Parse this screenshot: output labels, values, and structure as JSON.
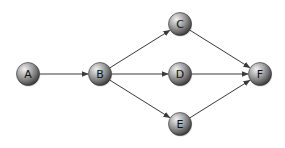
{
  "diagram": {
    "type": "directed-graph",
    "colors": {
      "background": "#ffffff",
      "edge": "#3a3a3a",
      "node_light": "#e8e8e8",
      "node_mid": "#9a9a9a",
      "node_dark": "#3c3c3c",
      "label": "#111111"
    },
    "node_radius": 11.5,
    "nodes": [
      {
        "id": "A",
        "label": "A",
        "x": 28,
        "y": 74
      },
      {
        "id": "B",
        "label": "B",
        "x": 100,
        "y": 74
      },
      {
        "id": "C",
        "label": "C",
        "x": 180,
        "y": 24
      },
      {
        "id": "D",
        "label": "D",
        "x": 180,
        "y": 74
      },
      {
        "id": "E",
        "label": "E",
        "x": 180,
        "y": 124
      },
      {
        "id": "F",
        "label": "F",
        "x": 260,
        "y": 74
      }
    ],
    "edges": [
      {
        "from": "A",
        "to": "B"
      },
      {
        "from": "B",
        "to": "C"
      },
      {
        "from": "B",
        "to": "D"
      },
      {
        "from": "B",
        "to": "E"
      },
      {
        "from": "C",
        "to": "F"
      },
      {
        "from": "D",
        "to": "F"
      },
      {
        "from": "E",
        "to": "F"
      }
    ]
  }
}
